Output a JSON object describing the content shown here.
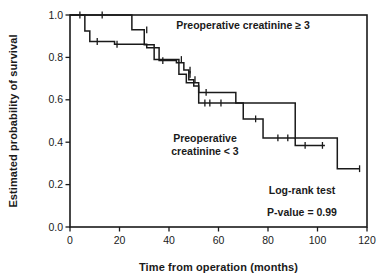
{
  "figure": {
    "title": "",
    "background": "#ffffff",
    "line_color": "#1a1a1a"
  },
  "axes": {
    "x_title": "Time from operation (months)",
    "y_title": "Estimated probability of survival",
    "x_ticks": [
      "0",
      "20",
      "40",
      "60",
      "80",
      "100",
      "120"
    ],
    "y_ticks": [
      "0.0",
      "0.2",
      "0.4",
      "0.6",
      "0.8",
      "1.0"
    ]
  },
  "annotations": {
    "curve_high_label": "Preoperative creatinine ≥ 3",
    "curve_low_label_line1": "Preoperative",
    "curve_low_label_line2": "creatinine < 3",
    "test_name": "Log-rank test",
    "p_value_text": "P-value = 0.99"
  },
  "chart_data": {
    "type": "line",
    "subtype": "kaplan-meier-step",
    "title": "",
    "xlabel": "Time from operation (months)",
    "ylabel": "Estimated probability of survival",
    "xlim": [
      0,
      120
    ],
    "ylim": [
      0.0,
      1.0
    ],
    "xticks": [
      0,
      20,
      40,
      60,
      80,
      100,
      120
    ],
    "yticks": [
      0.0,
      0.2,
      0.4,
      0.6,
      0.8,
      1.0
    ],
    "grid": false,
    "legend": "inline-annotations",
    "series": [
      {
        "name": "Preoperative creatinine ≥ 3",
        "label_position": "upper-right",
        "steps": [
          [
            0,
            1.0
          ],
          [
            25,
            1.0
          ],
          [
            25,
            0.93
          ],
          [
            30,
            0.93
          ],
          [
            30,
            0.86
          ],
          [
            34,
            0.86
          ],
          [
            34,
            0.79
          ],
          [
            44,
            0.79
          ],
          [
            44,
            0.72
          ],
          [
            47,
            0.72
          ],
          [
            47,
            0.68
          ],
          [
            52,
            0.68
          ],
          [
            52,
            0.635
          ],
          [
            67,
            0.635
          ],
          [
            67,
            0.585
          ],
          [
            91,
            0.585
          ],
          [
            91,
            0.42
          ],
          [
            108,
            0.42
          ],
          [
            108,
            0.275
          ],
          [
            117,
            0.275
          ]
        ],
        "censor_marks": [
          [
            31,
            0.93
          ],
          [
            45,
            0.79
          ],
          [
            48.5,
            0.72
          ],
          [
            55,
            0.635
          ],
          [
            117,
            0.275
          ]
        ]
      },
      {
        "name": "Preoperative creatinine < 3",
        "label_position": "center",
        "steps": [
          [
            0,
            1.0
          ],
          [
            6,
            1.0
          ],
          [
            6,
            0.925
          ],
          [
            8,
            0.925
          ],
          [
            8,
            0.875
          ],
          [
            18,
            0.875
          ],
          [
            18,
            0.862
          ],
          [
            31,
            0.862
          ],
          [
            31,
            0.845
          ],
          [
            36,
            0.845
          ],
          [
            36,
            0.785
          ],
          [
            43,
            0.785
          ],
          [
            43,
            0.775
          ],
          [
            46,
            0.775
          ],
          [
            46,
            0.74
          ],
          [
            48,
            0.74
          ],
          [
            48,
            0.695
          ],
          [
            50,
            0.695
          ],
          [
            50,
            0.665
          ],
          [
            52,
            0.665
          ],
          [
            52,
            0.585
          ],
          [
            70,
            0.585
          ],
          [
            70,
            0.51
          ],
          [
            78,
            0.51
          ],
          [
            78,
            0.42
          ],
          [
            91,
            0.42
          ],
          [
            91,
            0.385
          ],
          [
            103,
            0.385
          ]
        ],
        "censor_marks": [
          [
            4,
            1.0
          ],
          [
            13,
            1.0
          ],
          [
            11,
            0.875
          ],
          [
            19,
            0.862
          ],
          [
            37.5,
            0.785
          ],
          [
            48.5,
            0.74
          ],
          [
            50.5,
            0.695
          ],
          [
            54.5,
            0.585
          ],
          [
            56.5,
            0.585
          ],
          [
            61,
            0.585
          ],
          [
            75,
            0.51
          ],
          [
            84,
            0.42
          ],
          [
            88,
            0.42
          ],
          [
            95,
            0.385
          ],
          [
            102,
            0.385
          ]
        ]
      }
    ]
  }
}
